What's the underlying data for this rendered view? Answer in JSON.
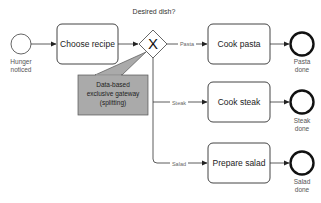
{
  "diagram": {
    "type": "BPMN process",
    "start_event": {
      "label_line1": "Hunger",
      "label_line2": "noticed"
    },
    "tasks": {
      "choose": "Choose recipe",
      "pasta": "Cook pasta",
      "steak": "Cook steak",
      "salad": "Prepare salad"
    },
    "gateway": {
      "question": "Desired dish?",
      "symbol": "X"
    },
    "annotation": {
      "line1": "Data-based",
      "line2": "exclusive gateway",
      "line3": "(splitting)",
      "fill": "#aaaaaa"
    },
    "flows": {
      "pasta": "Pasta",
      "steak": "Steak",
      "salad": "Salad"
    },
    "end_events": {
      "pasta": {
        "line1": "Pasta",
        "line2": "done"
      },
      "steak": {
        "line1": "Steak",
        "line2": "done"
      },
      "salad": {
        "line1": "Salad",
        "line2": "done"
      }
    }
  }
}
